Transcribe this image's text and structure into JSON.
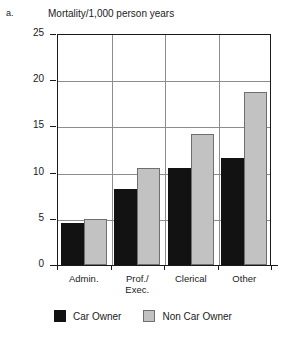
{
  "panel_letter": "a.",
  "legend": {
    "items": [
      {
        "label": "Car Owner",
        "swatch": "black-square-icon",
        "color": "#121212"
      },
      {
        "label": "Non Car Owner",
        "swatch": "gray-square-icon",
        "color": "#c2c2c2"
      }
    ]
  },
  "chart_data": {
    "type": "bar",
    "title": "Mortality/1,000 person years",
    "xlabel": "",
    "ylabel": "",
    "categories": [
      "Admin.",
      "Prof./\nExec.",
      "Clerical",
      "Other"
    ],
    "category_labels_line1": [
      "Admin.",
      "Prof./",
      "Clerical",
      "Other"
    ],
    "category_labels_line2": [
      "",
      "Exec.",
      "",
      ""
    ],
    "series": [
      {
        "name": "Car Owner",
        "color": "#121212",
        "values": [
          4.5,
          8.2,
          10.5,
          11.6
        ]
      },
      {
        "name": "Non Car Owner",
        "color": "#c2c2c2",
        "values": [
          5.0,
          10.5,
          14.2,
          18.7
        ]
      }
    ],
    "ylim": [
      0,
      25
    ],
    "yticks": [
      0,
      5,
      10,
      15,
      20,
      25
    ],
    "ytick_labels": [
      "0",
      "5",
      "10",
      "15",
      "20",
      "25"
    ],
    "grid": "horizontal-and-vertical",
    "legend_position": "bottom-center"
  }
}
